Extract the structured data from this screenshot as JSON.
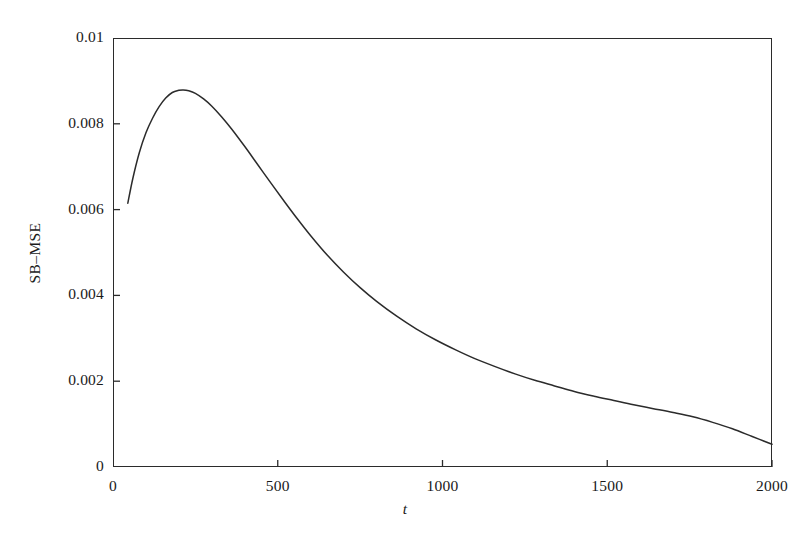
{
  "chart_data": {
    "type": "line",
    "title": "",
    "subtitle": "",
    "xlabel": "t",
    "ylabel": "SB–MSE",
    "xlim": [
      0,
      2000
    ],
    "ylim": [
      0,
      0.01
    ],
    "grid": false,
    "legend": null,
    "xticks": [
      0,
      500,
      1000,
      1500,
      2000
    ],
    "xticklabels": [
      "0",
      "500",
      "1000",
      "1500",
      "2000"
    ],
    "yticks": [
      0,
      0.002,
      0.004,
      0.006,
      0.008,
      0.01
    ],
    "yticklabels": [
      "0",
      "0.002",
      "0.004",
      "0.006",
      "0.008",
      "0.01"
    ],
    "series": [
      {
        "name": "SB-MSE",
        "color": "#2b2b2b",
        "x": [
          45,
          60,
          80,
          100,
          120,
          140,
          160,
          180,
          200,
          213,
          230,
          250,
          275,
          300,
          330,
          360,
          400,
          440,
          480,
          520,
          560,
          600,
          650,
          700,
          750,
          800,
          860,
          920,
          980,
          1040,
          1100,
          1160,
          1220,
          1280,
          1340,
          1400,
          1460,
          1520,
          1580,
          1640,
          1700,
          1760,
          1820,
          1880,
          1940,
          2000
        ],
        "y": [
          0.00615,
          0.00672,
          0.00733,
          0.00779,
          0.00813,
          0.0084,
          0.0086,
          0.00873,
          0.00878,
          0.00879,
          0.00877,
          0.00871,
          0.00858,
          0.00841,
          0.00816,
          0.00788,
          0.00747,
          0.00704,
          0.00661,
          0.00619,
          0.00578,
          0.00539,
          0.00494,
          0.00454,
          0.00418,
          0.00386,
          0.00352,
          0.00322,
          0.00296,
          0.00273,
          0.00252,
          0.00234,
          0.00217,
          0.00202,
          0.00189,
          0.00176,
          0.00165,
          0.00155,
          0.00145,
          0.00136,
          0.00127,
          0.00117,
          0.00104,
          0.00089,
          0.00071,
          0.00053
        ]
      }
    ],
    "annotations": {
      "peak_t": 213,
      "peak_value": 0.00879,
      "start_t": 45,
      "start_value": 0.00615,
      "end_t": 2000,
      "end_value": 0.00053
    },
    "style": {
      "axis_color": "#2b2b2b",
      "line_color": "#2b2b2b",
      "background": "#ffffff",
      "tick_direction": "in"
    }
  }
}
